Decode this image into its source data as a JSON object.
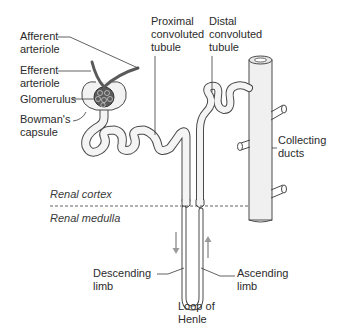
{
  "diagram": {
    "labels": {
      "afferent_arteriole": "Afferent\narteriole",
      "efferent_arteriole": "Efferent\narteriole",
      "glomerulus": "Glomerulus",
      "bowmans_capsule": "Bowman's\ncapsule",
      "proximal_tubule": "Proximal\nconvoluted\ntubule",
      "distal_tubule": "Distal\nconvoluted\ntubule",
      "collecting_ducts": "Collecting\nducts",
      "renal_cortex": "Renal cortex",
      "renal_medulla": "Renal medulla",
      "descending_limb": "Descending\nlimb",
      "ascending_limb": "Ascending\nlimb",
      "loop_of_henle": "Loop of\nHenle"
    },
    "colors": {
      "outline": "#4a4a4a",
      "arteriole": "#5a5a5a",
      "arrow": "#9a9a9a",
      "fill": "#f2f2f2",
      "text": "#2b2b2b"
    }
  }
}
